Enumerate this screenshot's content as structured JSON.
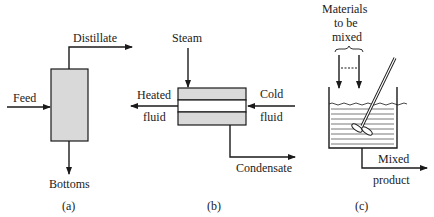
{
  "diagrams": [
    {
      "id": "a",
      "caption": "(a)",
      "title": "Separation column",
      "labels": {
        "feed": "Feed",
        "distillate": "Distillate",
        "bottoms": "Bottoms"
      }
    },
    {
      "id": "b",
      "caption": "(b)",
      "title": "Heat exchanger",
      "labels": {
        "steam": "Steam",
        "heated_1": "Heated",
        "heated_2": "fluid",
        "cold_1": "Cold",
        "cold_2": "fluid",
        "condensate": "Condensate"
      }
    },
    {
      "id": "c",
      "caption": "(c)",
      "title": "Mixing tank",
      "labels": {
        "materials_1": "Materials",
        "materials_2": "to be",
        "materials_3": "mixed",
        "mixed_1": "Mixed",
        "mixed_2": "product"
      }
    }
  ],
  "colors": {
    "line": "#1a1a1a",
    "fill": "#d9d9d9"
  }
}
